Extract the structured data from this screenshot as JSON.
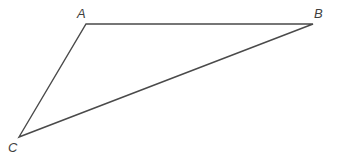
{
  "figure": {
    "type": "geometry-diagram",
    "shape": "triangle",
    "background_color": "#ffffff",
    "stroke_color": "#4a4a4a",
    "stroke_width": 1.4,
    "label_color": "#3f3f3f",
    "canvas": {
      "width": 337,
      "height": 167
    },
    "vertices": [
      {
        "name": "A",
        "label": "A",
        "x": 86,
        "y": 24,
        "label_x": 77,
        "label_y": 7
      },
      {
        "name": "B",
        "label": "B",
        "x": 313,
        "y": 24,
        "label_x": 314,
        "label_y": 7
      },
      {
        "name": "C",
        "label": "C",
        "x": 19,
        "y": 137,
        "label_x": 8,
        "label_y": 141
      }
    ],
    "edges": [
      {
        "name": "edge-AB",
        "from": "A",
        "to": "B"
      },
      {
        "name": "edge-BC",
        "from": "B",
        "to": "C"
      },
      {
        "name": "edge-CA",
        "from": "C",
        "to": "A"
      }
    ],
    "path": "M 86 24 L 313 24 L 19 137 Z"
  }
}
